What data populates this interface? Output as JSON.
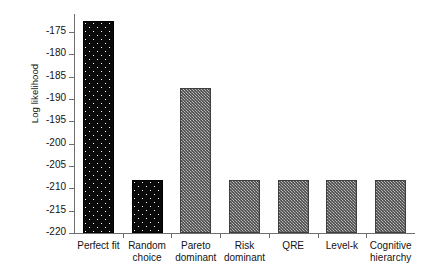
{
  "chart_data": {
    "type": "bar",
    "title": "",
    "subtitle": "",
    "xlabel": "",
    "ylabel": "Log likelihood",
    "categories": [
      "Perfect fit",
      "Random choice",
      "Pareto dominant",
      "Risk dominant",
      "QRE",
      "Level-k",
      "Cognitive hierarchy"
    ],
    "values": [
      -172.5,
      -208.2,
      -187.5,
      -208.2,
      -208.2,
      -208.2,
      -208.2
    ],
    "ylim": [
      -220,
      -171
    ],
    "yticks": [
      -175,
      -180,
      -185,
      -190,
      -195,
      -200,
      -205,
      -210,
      -215,
      -220
    ],
    "ytick_labels": [
      "-175",
      "-180",
      "-185",
      "-190",
      "-195",
      "-200",
      "-205",
      "-210",
      "-215",
      "-220"
    ],
    "grid": false,
    "legend": false,
    "legend_position": "none",
    "bar_styles": [
      "black-dotted",
      "black-dotted",
      "gray-hatched",
      "gray-hatched",
      "gray-hatched",
      "gray-hatched",
      "gray-hatched"
    ],
    "colors": {
      "bar_black": "#0a0a0a",
      "bar_gray": "#8c8c8c",
      "axis": "#6f6f6f",
      "text": "#131313",
      "background": "#ffffff"
    }
  },
  "axis": {
    "y_title": "Log likelihood"
  },
  "categories_wrapped": [
    [
      "Perfect fit",
      ""
    ],
    [
      "Random",
      "choice"
    ],
    [
      "Pareto",
      "dominant"
    ],
    [
      "Risk",
      "dominant"
    ],
    [
      "QRE",
      ""
    ],
    [
      "Level-k",
      ""
    ],
    [
      "Cognitive",
      "hierarchy"
    ]
  ]
}
